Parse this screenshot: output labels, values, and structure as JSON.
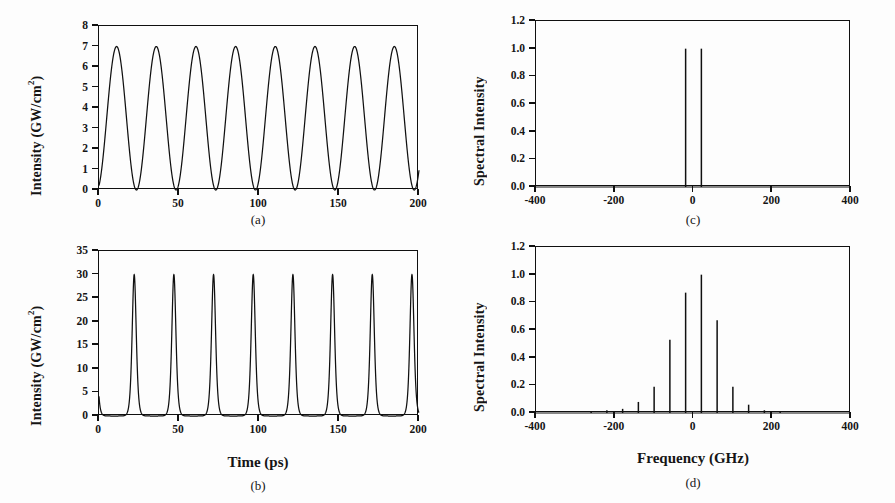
{
  "figure": {
    "background": "#ffffff",
    "line_color": "#101010",
    "panels": [
      "a",
      "b",
      "c",
      "d"
    ]
  },
  "panel_a": {
    "tag": "(a)",
    "ylabel_main": "Intensity (GW/cm",
    "ylabel_sup": "2",
    "ylabel_close": ")",
    "yticks": [
      "0",
      "1",
      "2",
      "3",
      "4",
      "5",
      "6",
      "7",
      "8"
    ],
    "xticks": [
      "0",
      "50",
      "100",
      "150",
      "200"
    ]
  },
  "panel_b": {
    "tag": "(b)",
    "ylabel_main": "Intensity (GW/cm",
    "ylabel_sup": "2",
    "ylabel_close": ")",
    "xlabel": "Time (ps)",
    "yticks": [
      "0",
      "5",
      "10",
      "15",
      "20",
      "25",
      "30",
      "35"
    ],
    "xticks": [
      "0",
      "50",
      "100",
      "150",
      "200"
    ]
  },
  "panel_c": {
    "tag": "(c)",
    "ylabel": "Spectral Intensity",
    "yticks": [
      "0.0",
      "0.2",
      "0.4",
      "0.6",
      "0.8",
      "1.0",
      "1.2"
    ],
    "xticks": [
      "-400",
      "-200",
      "0",
      "200",
      "400"
    ]
  },
  "panel_d": {
    "tag": "(d)",
    "ylabel": "Spectral Intensity",
    "xlabel": "Frequency (GHz)",
    "yticks": [
      "0.0",
      "0.2",
      "0.4",
      "0.6",
      "0.8",
      "1.0",
      "1.2"
    ],
    "xticks": [
      "-400",
      "-200",
      "0",
      "200",
      "400"
    ]
  },
  "chart_data": [
    {
      "id": "a",
      "type": "line",
      "title": "(a)",
      "xlabel": "",
      "ylabel": "Intensity (GW/cm^2)",
      "xlim": [
        0,
        200
      ],
      "ylim": [
        0,
        8
      ],
      "xticks": [
        0,
        50,
        100,
        150,
        200
      ],
      "yticks": [
        0,
        1,
        2,
        3,
        4,
        5,
        6,
        7,
        8
      ],
      "grid": false,
      "legend": null,
      "description": "Sinusoidal beat waveform, 40 GHz repetition (period 24.8 ps), 8 cycles over 200 ps",
      "waveform": {
        "form": "raised-cosine",
        "amplitude_peak": 7.0,
        "amplitude_min": 0.0,
        "period_ps": 24.8,
        "first_peak_ps": 11.0,
        "value_at_zero": 2.2,
        "num_peaks": 8
      },
      "peaks_x": [
        11.0,
        35.8,
        60.6,
        85.4,
        110.2,
        135.0,
        159.8,
        184.6
      ],
      "peaks_y": [
        7.0,
        7.0,
        7.0,
        7.0,
        7.0,
        7.0,
        7.0,
        7.0
      ],
      "minima_x": [
        23.4,
        48.2,
        73.0,
        97.8,
        122.6,
        147.4,
        172.2,
        197.0
      ],
      "minima_y": [
        0,
        0,
        0,
        0,
        0,
        0,
        0,
        0
      ]
    },
    {
      "id": "b",
      "type": "line",
      "title": "(b)",
      "xlabel": "Time (ps)",
      "ylabel": "Intensity (GW/cm^2)",
      "xlim": [
        0,
        200
      ],
      "ylim": [
        0,
        35
      ],
      "xticks": [
        0,
        50,
        100,
        150,
        200
      ],
      "yticks": [
        0,
        5,
        10,
        15,
        20,
        25,
        30,
        35
      ],
      "grid": false,
      "legend": null,
      "description": "Compressed pulse train, 40 GHz repetition, peak 30 GW/cm^2, FWHM about 3 ps",
      "waveform": {
        "form": "sech2-pulse-train",
        "amplitude_peak": 30.0,
        "baseline": 0.0,
        "period_ps": 24.8,
        "first_peak_ps": 22.0,
        "fwhm_ps": 3.0,
        "num_peaks": 8
      },
      "peaks_x": [
        22.0,
        46.8,
        71.6,
        96.4,
        121.2,
        146.0,
        170.8,
        195.6
      ],
      "peaks_y": [
        30.0,
        30.0,
        30.0,
        30.0,
        30.0,
        30.0,
        30.0,
        30.0
      ]
    },
    {
      "id": "c",
      "type": "bar",
      "title": "(c)",
      "xlabel": "",
      "ylabel": "Spectral Intensity",
      "xlim": [
        -400,
        400
      ],
      "ylim": [
        0.0,
        1.2
      ],
      "xticks": [
        -400,
        -200,
        0,
        200,
        400
      ],
      "yticks": [
        0.0,
        0.2,
        0.4,
        0.6,
        0.8,
        1.0,
        1.2
      ],
      "grid": false,
      "legend": null,
      "description": "Two-line input spectrum of a 40 GHz beat signal: lines at -20 and +20 GHz",
      "x": [
        -20,
        20
      ],
      "values": [
        1.0,
        1.0
      ]
    },
    {
      "id": "d",
      "type": "bar",
      "title": "(d)",
      "xlabel": "Frequency (GHz)",
      "ylabel": "Spectral Intensity",
      "xlim": [
        -400,
        400
      ],
      "ylim": [
        0.0,
        1.2
      ],
      "xticks": [
        -400,
        -200,
        0,
        200,
        400
      ],
      "yticks": [
        0.0,
        0.2,
        0.4,
        0.6,
        0.8,
        1.0,
        1.2
      ],
      "grid": false,
      "legend": null,
      "description": "Broadened frequency comb after nonlinear compression, 40 GHz line spacing, envelope peaking near +20 GHz",
      "x": [
        -260,
        -220,
        -180,
        -140,
        -100,
        -60,
        -20,
        20,
        60,
        100,
        140,
        180,
        220
      ],
      "values": [
        0.01,
        0.02,
        0.03,
        0.08,
        0.19,
        0.53,
        0.87,
        1.0,
        0.67,
        0.19,
        0.06,
        0.02,
        0.01
      ]
    }
  ]
}
